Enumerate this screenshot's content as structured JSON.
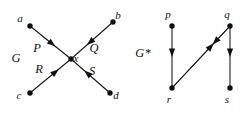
{
  "figure": {
    "background_color": "#ffffff",
    "ink_color": "#111111",
    "graphs": [
      {
        "name": "G",
        "label": "G",
        "label_pos": {
          "x": 16,
          "y": 62
        },
        "type": "directed-graph",
        "description": "Four edges converging on a single central vertex x",
        "vertices": [
          {
            "id": "a",
            "label": "a",
            "x": 30,
            "y": 26,
            "label_pos": {
              "x": 20,
              "y": 22
            }
          },
          {
            "id": "b",
            "label": "b",
            "x": 113,
            "y": 22,
            "label_pos": {
              "x": 118,
              "y": 19
            }
          },
          {
            "id": "c",
            "label": "c",
            "x": 30,
            "y": 93,
            "label_pos": {
              "x": 19,
              "y": 99
            }
          },
          {
            "id": "d",
            "label": "d",
            "x": 110,
            "y": 93,
            "label_pos": {
              "x": 116,
              "y": 99
            }
          },
          {
            "id": "x",
            "label": "x",
            "x": 71,
            "y": 59,
            "label_pos": {
              "x": 76,
              "y": 62
            }
          }
        ],
        "edges": [
          {
            "id": "P",
            "label": "P",
            "from": "a",
            "to": "x",
            "label_pos": {
              "x": 37,
              "y": 52
            },
            "arrow_t": 0.62
          },
          {
            "id": "Q",
            "label": "Q",
            "from": "b",
            "to": "x",
            "label_pos": {
              "x": 94,
              "y": 52
            },
            "arrow_t": 0.62
          },
          {
            "id": "R",
            "label": "R",
            "from": "c",
            "to": "x",
            "label_pos": {
              "x": 39,
              "y": 73
            },
            "arrow_t": 0.7
          },
          {
            "id": "S",
            "label": "S",
            "from": "d",
            "to": "x",
            "label_pos": {
              "x": 92,
              "y": 75
            },
            "arrow_t": 0.66
          }
        ]
      },
      {
        "name": "G-star",
        "label": "G*",
        "label_pos": {
          "x": 143,
          "y": 57
        },
        "type": "directed-graph",
        "description": "Line graph: vertices p,q on top and r,s on bottom with four directed edges",
        "vertices": [
          {
            "id": "p",
            "label": "p",
            "x": 172,
            "y": 26,
            "label_pos": {
              "x": 168,
              "y": 18
            }
          },
          {
            "id": "q",
            "label": "q",
            "x": 230,
            "y": 26,
            "label_pos": {
              "x": 227,
              "y": 18
            }
          },
          {
            "id": "r",
            "label": "r",
            "x": 172,
            "y": 88,
            "label_pos": {
              "x": 169,
              "y": 103
            }
          },
          {
            "id": "s",
            "label": "s",
            "x": 230,
            "y": 88,
            "label_pos": {
              "x": 227,
              "y": 103
            }
          }
        ],
        "edges": [
          {
            "id": "pr",
            "from": "p",
            "to": "r",
            "arrow_t": 0.5
          },
          {
            "id": "qs",
            "from": "q",
            "to": "s",
            "arrow_t": 0.5
          },
          {
            "id": "qr",
            "from": "q",
            "to": "r",
            "arrow_t": 0.3
          },
          {
            "id": "rq",
            "from": "r",
            "to": "q",
            "arrow_t": 0.72
          }
        ]
      }
    ]
  }
}
